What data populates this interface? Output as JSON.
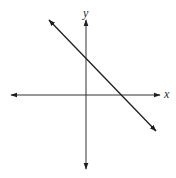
{
  "diagram": {
    "type": "coordinate-plane-line",
    "axes": {
      "x_label": "x",
      "y_label": "y",
      "origin_px": [
        86,
        95
      ],
      "x_axis_px": {
        "from": [
          11,
          95
        ],
        "to": [
          160,
          95
        ],
        "arrows": "both"
      },
      "y_axis_px": {
        "from": [
          86,
          20
        ],
        "to": [
          86,
          169
        ],
        "arrows": "both"
      }
    },
    "line": {
      "slope_sign": "negative",
      "from_px": [
        49,
        20
      ],
      "to_px": [
        156,
        131
      ],
      "arrows": "both",
      "y_intercept_px": [
        86,
        59
      ],
      "x_intercept_px": [
        121,
        95
      ]
    },
    "colors": {
      "stroke": "#1e1e1e",
      "axis_stroke": "#333333",
      "background": "#ffffff"
    }
  }
}
